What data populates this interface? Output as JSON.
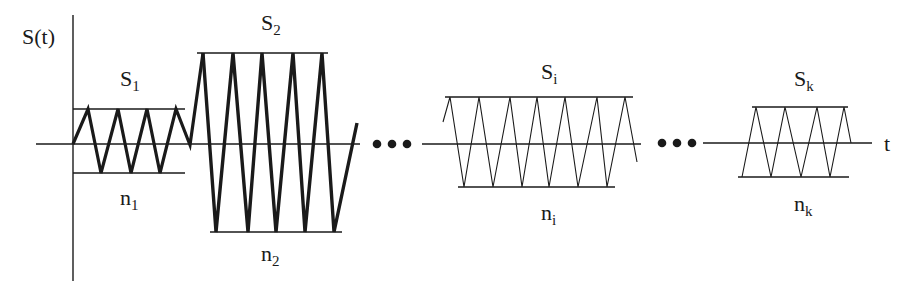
{
  "diagram": {
    "y_axis_label": "S(t)",
    "x_axis_label": "t",
    "ellipsis": "•••",
    "segments": [
      {
        "id": "1",
        "upper_label_base": "S",
        "upper_label_sub": "1",
        "lower_label_base": "n",
        "lower_label_sub": "1",
        "cycles": 4,
        "stroke": "thick"
      },
      {
        "id": "2",
        "upper_label_base": "S",
        "upper_label_sub": "2",
        "lower_label_base": "n",
        "lower_label_sub": "2",
        "cycles": 5,
        "stroke": "thick"
      },
      {
        "id": "i",
        "upper_label_base": "S",
        "upper_label_sub": "i",
        "lower_label_base": "n",
        "lower_label_sub": "i",
        "cycles": 7,
        "stroke": "thin"
      },
      {
        "id": "k",
        "upper_label_base": "S",
        "upper_label_sub": "k",
        "lower_label_base": "n",
        "lower_label_sub": "k",
        "cycles": 4,
        "stroke": "thin"
      }
    ],
    "colors": {
      "line": "#1a1a1a",
      "background": "#ffffff"
    }
  }
}
